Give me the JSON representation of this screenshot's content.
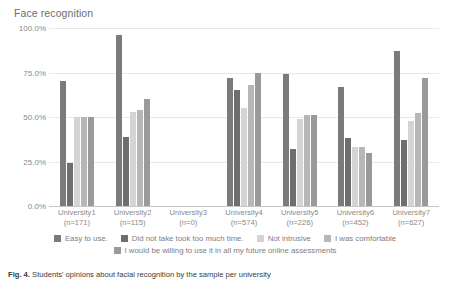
{
  "chart_data": {
    "type": "bar",
    "title": "Face recognition",
    "xlabel": "",
    "ylabel": "",
    "ylim": [
      0,
      100
    ],
    "grid": true,
    "legend_position": "bottom",
    "ytick_labels": [
      "0.0%",
      "25.0%",
      "50.0%",
      "75.0%",
      "100.0%"
    ],
    "ytick_values": [
      0,
      25,
      50,
      75,
      100
    ],
    "categories": [
      "University1",
      "University2",
      "University3",
      "University4",
      "University5",
      "University6",
      "University7"
    ],
    "category_sublabels": [
      "(n=171)",
      "(n=115)",
      "(n=0)",
      "(n=574)",
      "(n=226)",
      "(n=452)",
      "(n=627)"
    ],
    "series": [
      {
        "name": "Easy to use.",
        "color": "#7b7b7b",
        "values": [
          70,
          96,
          0,
          72,
          74,
          67,
          87
        ]
      },
      {
        "name": "Did not take took too much time.",
        "color": "#6e6e6e",
        "values": [
          24,
          39,
          0,
          65,
          32,
          38,
          37
        ]
      },
      {
        "name": "Not intrusive",
        "color": "#d4d4d4",
        "values": [
          50,
          53,
          0,
          55,
          49,
          33,
          48
        ]
      },
      {
        "name": "I was comfortable",
        "color": "#b7b7b7",
        "values": [
          50,
          54,
          0,
          68,
          51,
          33,
          52
        ]
      },
      {
        "name": "I would be willing to use it in all my future online assessments",
        "color": "#9a9a9a",
        "values": [
          50,
          60,
          0,
          75,
          51,
          30,
          72
        ]
      }
    ]
  },
  "caption": {
    "prefix": "Fig. 4.",
    "text": "Students' opinions about facial recognition by the sample per university"
  }
}
